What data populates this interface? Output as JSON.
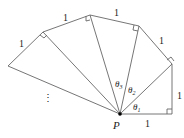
{
  "diagram": {
    "point_label": "P",
    "edge_labels": [
      "1",
      "1",
      "1",
      "1",
      "1",
      "1"
    ],
    "angle_labels": [
      "θ1",
      "θ2",
      "θ3"
    ],
    "ellipsis": "⋮",
    "colors": {
      "line": "#555555",
      "point": "#000000"
    }
  }
}
